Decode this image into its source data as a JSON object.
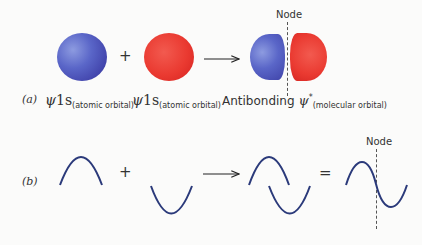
{
  "row_a": {
    "label": "(a)",
    "operator_plus": "+",
    "left_orbital": {
      "symbol": "ψ",
      "name": "1s",
      "subscript": "(atomic orbital)",
      "color": "#4a52b8"
    },
    "right_orbital": {
      "symbol": "ψ",
      "name": "1s",
      "subscript": "(atomic orbital)",
      "color": "#e83a30"
    },
    "result": {
      "prefix": "Antibonding",
      "symbol": "ψ",
      "superscript": "*",
      "subscript": "(molecular orbital)"
    },
    "node_label": "Node"
  },
  "row_b": {
    "label": "(b)",
    "operator_plus": "+",
    "operator_equals": "=",
    "node_label": "Node",
    "wave_color": "#2b3a7a"
  }
}
